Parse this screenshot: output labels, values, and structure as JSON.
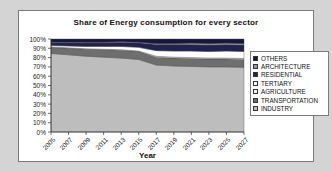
{
  "chart": {
    "title": "Share of Energy consumption for every sector",
    "xlabel": "Year"
  },
  "chart_data": {
    "type": "area",
    "stacked": true,
    "title": "Share of Energy consumption for every sector",
    "xlabel": "Year",
    "ylabel": "",
    "ylim": [
      0,
      100
    ],
    "yticks": [
      "100%",
      "90%",
      "80%",
      "70%",
      "60%",
      "50%",
      "40%",
      "30%",
      "20%",
      "10%",
      "0%"
    ],
    "legend_position": "right",
    "categories": [
      "2005",
      "2007",
      "2009",
      "2011",
      "2013",
      "2015",
      "2017",
      "2019",
      "2021",
      "2023",
      "2025",
      "2027"
    ],
    "series": [
      {
        "name": "OTHERS",
        "color": "#161640",
        "values": [
          3.5,
          3.5,
          3.5,
          3.5,
          3.0,
          3.5,
          5.0,
          5.0,
          4.5,
          5.0,
          4.5,
          5.0
        ]
      },
      {
        "name": "ARCHITECTURE",
        "color": "#9a9a9a",
        "values": [
          0.5,
          0.5,
          0.5,
          0.5,
          0.5,
          0.5,
          1.0,
          1.0,
          1.5,
          1.5,
          1.5,
          1.5
        ]
      },
      {
        "name": "RESIDENTIAL",
        "color": "#222250",
        "values": [
          3.0,
          3.5,
          4.0,
          4.0,
          4.5,
          5.0,
          6.5,
          7.0,
          7.0,
          7.0,
          7.0,
          7.0
        ]
      },
      {
        "name": "TERTIARY",
        "color": "#ffffff",
        "values": [
          1.5,
          2.0,
          2.5,
          3.0,
          3.5,
          4.0,
          6.0,
          6.5,
          7.0,
          7.0,
          7.5,
          7.5
        ]
      },
      {
        "name": "AGRICULTURE",
        "color": "#f4f4f4",
        "values": [
          0.5,
          0.5,
          0.5,
          0.5,
          0.5,
          0.5,
          1.0,
          1.0,
          1.0,
          1.0,
          1.0,
          1.0
        ]
      },
      {
        "name": "TRANSPORTATION",
        "color": "#6e6e6e",
        "values": [
          6.5,
          7.0,
          7.5,
          8.0,
          8.5,
          8.5,
          8.5,
          8.5,
          8.5,
          8.5,
          8.5,
          8.5
        ]
      },
      {
        "name": "INDUSTRY",
        "color": "#bdbdbd",
        "values": [
          84.5,
          83.0,
          81.5,
          80.5,
          79.5,
          78.0,
          72.0,
          71.0,
          70.5,
          70.0,
          70.0,
          69.5
        ]
      }
    ],
    "colors": {
      "axis": "#333333",
      "area_outline": "#4a4a4a",
      "frame_border": "#7a7a7a",
      "page_background": "#d4d4d4",
      "plot_background": "#ffffff"
    }
  }
}
